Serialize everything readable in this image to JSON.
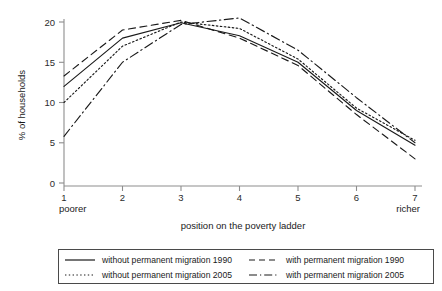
{
  "chart_data": {
    "type": "line",
    "title": "",
    "xlabel": "position on the poverty ladder",
    "ylabel": "% of households",
    "categories": [
      "1",
      "2",
      "3",
      "4",
      "5",
      "6",
      "7"
    ],
    "x": [
      1,
      2,
      3,
      4,
      5,
      6,
      7
    ],
    "xlim": [
      1,
      7
    ],
    "ylim": [
      0,
      21
    ],
    "yticks": [
      "0",
      "5",
      "10",
      "15",
      "20"
    ],
    "ytick_values": [
      0,
      5,
      10,
      15,
      20
    ],
    "xticks": [
      "1",
      "2",
      "3",
      "4",
      "5",
      "6",
      "7"
    ],
    "grid": false,
    "legend_position": "below-plot",
    "x_axis_endpoint_labels": {
      "left": "poorer",
      "right": "richer"
    },
    "series": [
      {
        "name": "without permanent migration 1990",
        "style": "solid",
        "values": [
          12.0,
          18.0,
          19.9,
          18.3,
          15.0,
          9.0,
          4.7
        ]
      },
      {
        "name": "with permanent migration 1990",
        "style": "dashed",
        "values": [
          13.3,
          19.0,
          20.2,
          18.0,
          14.6,
          8.5,
          3.0
        ]
      },
      {
        "name": "without permanent migration 2005",
        "style": "dotted",
        "values": [
          10.0,
          17.0,
          20.0,
          19.2,
          15.4,
          9.3,
          5.3
        ]
      },
      {
        "name": "with permanent migration 2005",
        "style": "dash-dot",
        "values": [
          5.8,
          15.0,
          19.7,
          20.5,
          16.5,
          10.6,
          5.0
        ]
      }
    ]
  },
  "axes": {
    "y_title": "% of households",
    "x_title": "position on the poverty ladder",
    "y_ticks": [
      "20",
      "15",
      "10",
      "5",
      "0"
    ],
    "x_ticks": [
      "1",
      "2",
      "3",
      "4",
      "5",
      "6",
      "7"
    ],
    "poorer_label": "poorer",
    "richer_label": "richer"
  },
  "legend": {
    "items": [
      {
        "label": "without permanent migration 1990",
        "style": "solid"
      },
      {
        "label": "with permanent migration 1990",
        "style": "dashed"
      },
      {
        "label": "without permanent migration 2005",
        "style": "dotted"
      },
      {
        "label": "with permanent migration 2005",
        "style": "dash-dot"
      }
    ]
  },
  "colors": {
    "line": "#1a1a1a",
    "axis": "#8d8d8d",
    "legend_border": "#4a4a4a",
    "background": "#ffffff"
  }
}
